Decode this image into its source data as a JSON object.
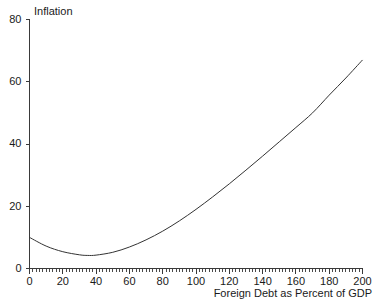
{
  "chart_data": {
    "type": "line",
    "title": "",
    "xlabel": "Foreign Debt as Percent of GDP",
    "ylabel": "Inflation",
    "xlim": [
      0,
      200
    ],
    "ylim": [
      0,
      80
    ],
    "grid": false,
    "legend": null,
    "x_major_ticks": [
      0,
      20,
      40,
      60,
      80,
      100,
      120,
      140,
      160,
      180,
      200
    ],
    "x_minor_tick_step": 2,
    "y_major_ticks": [
      0,
      20,
      40,
      60,
      80
    ],
    "x_tick_labels": [
      "0",
      "20",
      "40",
      "60",
      "80",
      "100",
      "120",
      "140",
      "160",
      "180",
      "200"
    ],
    "y_tick_labels": [
      "0",
      "20",
      "40",
      "60",
      "80"
    ],
    "series": [
      {
        "name": "Inflation",
        "color": "#333333",
        "x": [
          0,
          10,
          20,
          30,
          35,
          40,
          50,
          60,
          70,
          80,
          90,
          100,
          110,
          120,
          130,
          140,
          150,
          160,
          170,
          180,
          190,
          200
        ],
        "y": [
          10.0,
          7.2,
          5.4,
          4.4,
          4.2,
          4.3,
          5.2,
          6.9,
          9.2,
          12.0,
          15.3,
          19.0,
          23.0,
          27.2,
          31.6,
          36.1,
          40.7,
          45.3,
          50.0,
          55.7,
          61.2,
          67.0
        ]
      }
    ]
  },
  "labels": {
    "y_axis_title": "Inflation",
    "x_axis_title": "Foreign Debt as Percent of GDP"
  },
  "colors": {
    "curve": "#333333",
    "axis": "#3a3a3a",
    "background": "#ffffff",
    "text": "#1a1a1a"
  }
}
